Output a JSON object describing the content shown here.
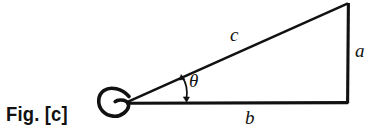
{
  "figure": {
    "caption": "Fig. [c]",
    "type": "right-triangle-diagram",
    "stroke_color": "#111111",
    "background_color": "#ffffff",
    "labels": {
      "hypotenuse": "c",
      "opposite": "a",
      "adjacent": "b",
      "angle": "θ"
    },
    "geometry": {
      "vertex_left": [
        126,
        103
      ],
      "vertex_right_angle": [
        348,
        103
      ],
      "vertex_top": [
        348,
        3
      ],
      "loop_center": [
        117,
        100
      ]
    }
  }
}
